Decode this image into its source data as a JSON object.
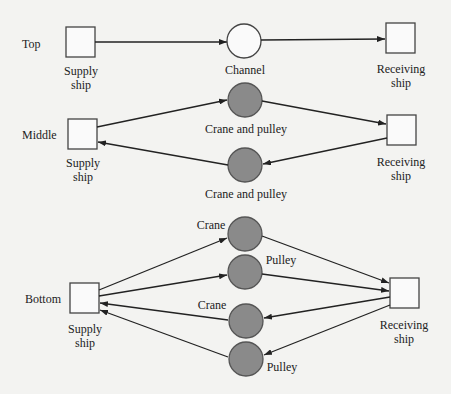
{
  "diagram": {
    "rows": [
      {
        "label": "Top",
        "supply": "Supply\nship",
        "receiving": "Receiving\nship",
        "nodes": [
          {
            "label": "Channel",
            "filled": false
          }
        ]
      },
      {
        "label": "Middle",
        "supply": "Supply\nship",
        "receiving": "Receiving\nship",
        "nodes": [
          {
            "label": "Crane and pulley",
            "filled": true,
            "direction": "supply-to-receiving"
          },
          {
            "label": "Crane and pulley",
            "filled": true,
            "direction": "receiving-to-supply"
          }
        ]
      },
      {
        "label": "Bottom",
        "supply": "Supply\nship",
        "receiving": "Receiving\nship",
        "nodes": [
          {
            "label": "Crane",
            "filled": true,
            "direction": "supply-to-receiving"
          },
          {
            "label": "Pulley",
            "filled": true,
            "direction": "supply-to-receiving"
          },
          {
            "label": "Crane",
            "filled": true,
            "direction": "receiving-to-supply"
          },
          {
            "label": "Pulley",
            "filled": true,
            "direction": "receiving-to-supply"
          }
        ]
      }
    ],
    "colors": {
      "node_fill": "#8a8a8a",
      "stroke": "#222222",
      "background": "#f3f3f1"
    }
  }
}
